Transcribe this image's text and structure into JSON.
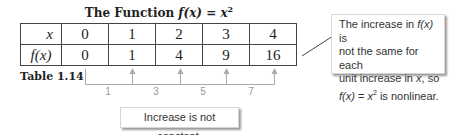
{
  "title": {
    "prefix": "The Function ",
    "func": "f(x)",
    "eq": " = ",
    "base": "x",
    "exp": "2"
  },
  "table": {
    "row_headers": [
      "x",
      "f(x)"
    ],
    "x_values": [
      "0",
      "1",
      "2",
      "3",
      "4"
    ],
    "fx_values": [
      "0",
      "1",
      "4",
      "9",
      "16"
    ]
  },
  "caption": "Table 1.14",
  "differences": [
    "1",
    "3",
    "5",
    "7"
  ],
  "callouts": {
    "bottom": "Increase is not constant.",
    "right": {
      "line1_a": "The increase in ",
      "line1_f": "f(x)",
      "line1_b": " is",
      "line2": "not the same for each",
      "line3_a": "unit increase in ",
      "line3_x": "x",
      "line3_b": ", so",
      "line4_f": "f(x)",
      "line4_eq": " = ",
      "line4_x": "x",
      "line4_exp": "2",
      "line4_b": " is nonlinear."
    }
  },
  "colors": {
    "bracket": "#aaaaaa",
    "border": "#444444"
  }
}
